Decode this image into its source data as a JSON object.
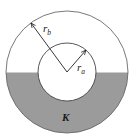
{
  "diagram": {
    "type": "concentric-circles-partially-filled",
    "labels": {
      "outer_radius": {
        "main": "r",
        "sub": "b"
      },
      "inner_radius": {
        "main": "r",
        "sub": "a"
      },
      "dielectric": "K"
    },
    "colors": {
      "fill": "#9b9b9b",
      "stroke": "#555555",
      "background": "#ffffff"
    }
  }
}
